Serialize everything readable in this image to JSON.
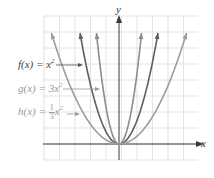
{
  "chart_data": {
    "type": "line",
    "title": "",
    "xlabel": "x",
    "ylabel": "y",
    "grid": true,
    "series": [
      {
        "name": "f(x) = x^2",
        "a": 1,
        "color": "#6b6b6b"
      },
      {
        "name": "g(x) = 3x^2",
        "a": 3,
        "color": "#8a8a8a"
      },
      {
        "name": "h(x) = (1/3)x^2",
        "a": 0.3333,
        "color": "#9a9a9a"
      }
    ],
    "vertex": [
      0,
      0
    ],
    "annotations": [
      "f(x) = x^2",
      "g(x) = 3x^2",
      "h(x) = 1/3 x^2"
    ]
  },
  "axes": {
    "x_label": "x",
    "y_label": "y"
  },
  "labels": {
    "f": {
      "prefix": "f(x) = x",
      "exp": "2"
    },
    "g": {
      "prefix": "g(x) = 3x",
      "exp": "2"
    },
    "h": {
      "prefix": "h(x) = ",
      "num": "1",
      "den": "3",
      "var": "x",
      "exp": "2"
    }
  },
  "colors": {
    "grid": "#dcdcdc",
    "axis": "#3a3a3a",
    "f": "#5e5e5e",
    "g": "#8c8c8c",
    "h": "#9c9c9c",
    "label_f": "#444444",
    "label_g": "#9a9a9a",
    "label_h": "#9a9a9a"
  }
}
